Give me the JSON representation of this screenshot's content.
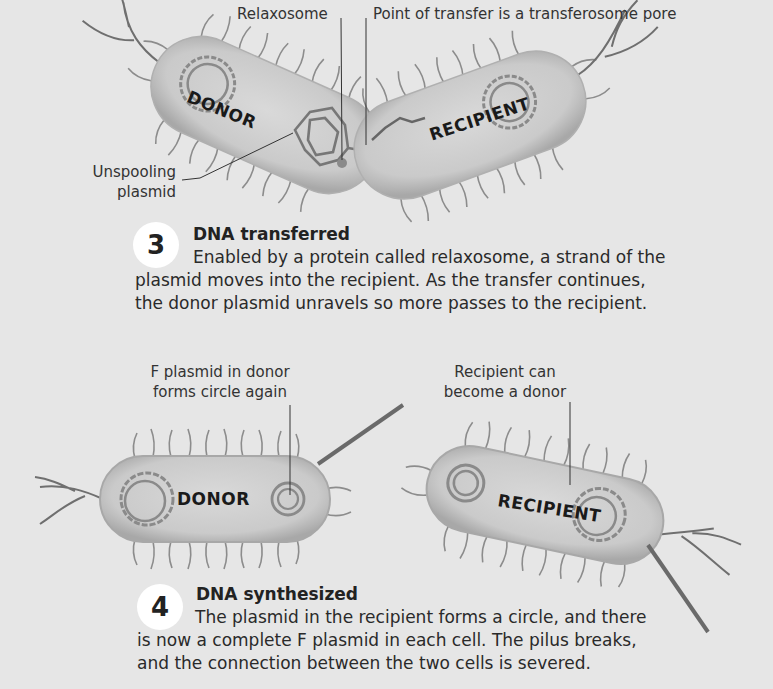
{
  "panel3": {
    "labels": {
      "relaxosome": "Relaxosome",
      "point_of_transfer": "Point of transfer is a transferosome pore",
      "unspooling_line1": "Unspooling",
      "unspooling_line2": "plasmid"
    },
    "cells": {
      "donor": "DONOR",
      "recipient": "RECIPIENT"
    },
    "step": {
      "number": "3",
      "title": "DNA transferred",
      "body_line1": "Enabled by a protein called relaxosome, a strand of the",
      "body_line2": "plasmid moves into the recipient. As the transfer continues,",
      "body_line3": "the donor plasmid unravels so more passes to the recipient."
    }
  },
  "panel4": {
    "labels": {
      "f_plasmid_line1": "F plasmid in donor",
      "f_plasmid_line2": "forms circle again",
      "recipient_can_line1": "Recipient can",
      "recipient_can_line2": "become a donor"
    },
    "cells": {
      "donor": "DONOR",
      "recipient": "RECIPIENT"
    },
    "step": {
      "number": "4",
      "title": "DNA synthesized",
      "body_line1": "The plasmid in the recipient forms a circle, and there",
      "body_line2": "is now a complete F plasmid in each cell. The pilus breaks,",
      "body_line3": "and the connection between the two cells is severed."
    }
  },
  "colors": {
    "background": "#e6e6e6",
    "cell_fill": "#cfcfcf",
    "cell_outline": "#9a9a9a",
    "plasmid": "#8a8a8a",
    "pili": "#8c8c8c",
    "badge": "#ffffff",
    "text": "#2a2a2a"
  }
}
